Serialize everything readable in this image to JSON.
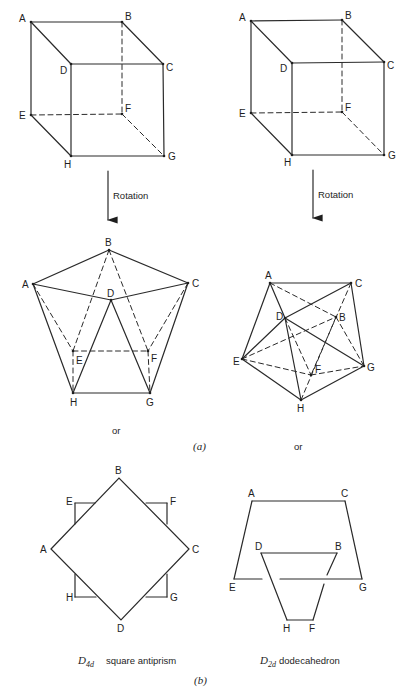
{
  "figure": {
    "part_a_label": "(a)",
    "part_b_label": "(b)",
    "rotation_label": "Rotation",
    "or_label": "or",
    "cubes": [
      {
        "name": "left-cube",
        "vertices": [
          "A",
          "B",
          "C",
          "D",
          "E",
          "F",
          "G",
          "H"
        ],
        "solid_edges": [
          [
            "A",
            "B"
          ],
          [
            "A",
            "D"
          ],
          [
            "B",
            "C"
          ],
          [
            "D",
            "C"
          ],
          [
            "A",
            "E"
          ],
          [
            "D",
            "H"
          ],
          [
            "C",
            "G"
          ],
          [
            "E",
            "H"
          ],
          [
            "H",
            "G"
          ]
        ],
        "dashed_edges": [
          [
            "B",
            "F"
          ],
          [
            "E",
            "F"
          ],
          [
            "F",
            "G"
          ]
        ]
      },
      {
        "name": "right-cube",
        "vertices": [
          "A",
          "B",
          "C",
          "D",
          "E",
          "F",
          "G",
          "H"
        ],
        "solid_edges": [
          [
            "A",
            "B"
          ],
          [
            "A",
            "D"
          ],
          [
            "B",
            "C"
          ],
          [
            "D",
            "C"
          ],
          [
            "A",
            "E"
          ],
          [
            "D",
            "H"
          ],
          [
            "C",
            "G"
          ],
          [
            "E",
            "H"
          ],
          [
            "H",
            "G"
          ]
        ],
        "dashed_edges": [
          [
            "B",
            "F"
          ],
          [
            "E",
            "F"
          ],
          [
            "F",
            "G"
          ]
        ]
      }
    ],
    "rotated": [
      {
        "name": "square-antiprism-view",
        "vertices": [
          "A",
          "B",
          "C",
          "D",
          "E",
          "F",
          "G",
          "H"
        ],
        "solid_edges": [
          [
            "A",
            "B"
          ],
          [
            "B",
            "C"
          ],
          [
            "A",
            "D"
          ],
          [
            "D",
            "C"
          ],
          [
            "A",
            "H"
          ],
          [
            "C",
            "G"
          ],
          [
            "H",
            "G"
          ],
          [
            "D",
            "H"
          ],
          [
            "D",
            "G"
          ]
        ],
        "dashed_edges": [
          [
            "B",
            "E"
          ],
          [
            "B",
            "F"
          ],
          [
            "A",
            "E"
          ],
          [
            "C",
            "F"
          ],
          [
            "E",
            "F"
          ],
          [
            "E",
            "H"
          ],
          [
            "F",
            "G"
          ]
        ]
      },
      {
        "name": "dodecahedron-view",
        "vertices": [
          "A",
          "B",
          "C",
          "D",
          "E",
          "F",
          "G",
          "H"
        ],
        "solid_edges": [
          [
            "A",
            "C"
          ],
          [
            "A",
            "E"
          ],
          [
            "A",
            "D"
          ],
          [
            "D",
            "H"
          ],
          [
            "C",
            "G"
          ],
          [
            "D",
            "C"
          ],
          [
            "D",
            "E"
          ],
          [
            "D",
            "G"
          ],
          [
            "E",
            "H"
          ],
          [
            "H",
            "G"
          ]
        ],
        "dashed_edges": [
          [
            "A",
            "B"
          ],
          [
            "E",
            "B"
          ],
          [
            "E",
            "F"
          ],
          [
            "F",
            "G"
          ],
          [
            "D",
            "F"
          ],
          [
            "H",
            "B"
          ],
          [
            "B",
            "G"
          ],
          [
            "C",
            "F"
          ]
        ]
      }
    ],
    "projections": [
      {
        "name": "square-antiprism-projection",
        "caption_symbol": "D",
        "caption_sub": "4d",
        "caption_text": "square antiprism",
        "vertices": [
          "A",
          "B",
          "C",
          "D",
          "E",
          "F",
          "G",
          "H"
        ]
      },
      {
        "name": "dodecahedron-projection",
        "caption_symbol": "D",
        "caption_sub": "2d",
        "caption_text": "dodecahedron",
        "vertices": [
          "A",
          "B",
          "C",
          "D",
          "E",
          "F",
          "G",
          "H"
        ]
      }
    ]
  }
}
